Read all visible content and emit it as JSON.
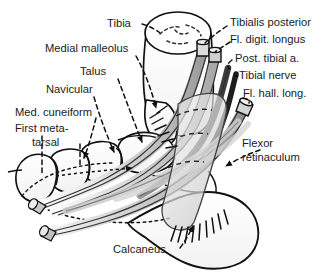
{
  "figure": {
    "type": "anatomical-line-diagram",
    "background_color": "#ffffff",
    "line_color": "#111111",
    "label_color": "#1a1a1a",
    "tendon_fill_light": "#d8d8d8",
    "tendon_fill_mid": "#b4b4b4",
    "tendon_fill_dark": "#4a4a4a",
    "nerve_fill": "#2b2b2b",
    "retinaculum_fill": "#dcdcdc"
  },
  "labels": {
    "tibia": "Tibia",
    "medial_malleolus": "Medial malleolus",
    "talus": "Talus",
    "navicular": "Navicular",
    "med_cuneiform": "Med. cuneiform",
    "first_metatarsal_line1": "First meta-",
    "first_metatarsal_line2": "tarsal",
    "tibialis_posterior": "Tibialis posterior",
    "fl_digit_longus": "Fl. digit. longus",
    "post_tibial_a": "Post. tibial a.",
    "tibial_nerve": "Tibial nerve",
    "fl_hall_long": "Fl. hall. long.",
    "flexor_retinaculum_line1": "Flexor",
    "flexor_retinaculum_line2": "retinaculum",
    "calcaneus": "Calcaneus"
  },
  "structures": [
    {
      "name": "tibia",
      "kind": "bone",
      "label": "Tibia"
    },
    {
      "name": "medial-malleolus",
      "kind": "bone",
      "label": "Medial malleolus"
    },
    {
      "name": "talus",
      "kind": "bone",
      "label": "Talus"
    },
    {
      "name": "navicular",
      "kind": "bone",
      "label": "Navicular"
    },
    {
      "name": "medial-cuneiform",
      "kind": "bone",
      "label": "Med. cuneiform"
    },
    {
      "name": "first-metatarsal",
      "kind": "bone",
      "label": "First metatarsal"
    },
    {
      "name": "calcaneus",
      "kind": "bone",
      "label": "Calcaneus"
    },
    {
      "name": "tibialis-posterior",
      "kind": "tendon",
      "label": "Tibialis posterior"
    },
    {
      "name": "flexor-digitorum-longus",
      "kind": "tendon",
      "label": "Fl. digit. longus"
    },
    {
      "name": "posterior-tibial-artery",
      "kind": "artery",
      "label": "Post. tibial a."
    },
    {
      "name": "tibial-nerve",
      "kind": "nerve",
      "label": "Tibial nerve"
    },
    {
      "name": "flexor-hallucis-longus",
      "kind": "tendon",
      "label": "Fl. hall. long."
    },
    {
      "name": "flexor-retinaculum",
      "kind": "ligament",
      "label": "Flexor retinaculum"
    }
  ]
}
